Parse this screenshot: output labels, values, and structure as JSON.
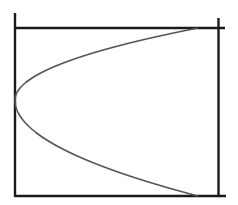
{
  "diagram": {
    "background": "#ffffff",
    "frame_color": "#1a1a1a",
    "curve_color": "#555555",
    "frame_lines": [
      {
        "name": "left-vertical-line",
        "x1": 15,
        "y1": 13,
        "x2": 15,
        "y2": 197
      },
      {
        "name": "top-horizontal-line",
        "x1": 15,
        "y1": 28,
        "x2": 225,
        "y2": 28
      },
      {
        "name": "right-vertical-line",
        "x1": 218.5,
        "y1": 18,
        "x2": 218.5,
        "y2": 197
      },
      {
        "name": "bottom-horizontal-line",
        "x1": 15,
        "y1": 196,
        "x2": 226,
        "y2": 196
      }
    ],
    "curve": {
      "name": "parabola-curve",
      "type": "parabola-opening-right",
      "vertex": [
        15,
        100
      ],
      "top_end": [
        198,
        28
      ],
      "bottom_end": [
        198,
        196
      ]
    }
  }
}
